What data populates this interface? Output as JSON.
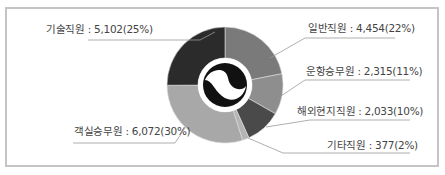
{
  "chart_data": {
    "type": "pie",
    "variant": "donut",
    "title": "",
    "categories": [
      "일반직원",
      "운항승무원",
      "해외현지직원",
      "기타직원",
      "객실승무원",
      "기술직원"
    ],
    "values": [
      4454,
      2315,
      2033,
      377,
      6072,
      5102
    ],
    "percentages": [
      22,
      11,
      10,
      2,
      30,
      25
    ],
    "colors": [
      "#7a7a7a",
      "#8e8e8e",
      "#4a4a4a",
      "#b4b4b4",
      "#a8a8a8",
      "#2b2b2b"
    ],
    "labels": [
      "일반직원 : 4,454(22%)",
      "운항승무원 : 2,315(11%)",
      "해외현지직원 : 2,033(10%)",
      "기타직원 : 377(2%)",
      "객실승무원 : 6,072(30%)",
      "기술직원 : 5,102(25%)"
    ],
    "start_angle": "12 o'clock",
    "direction": "clockwise",
    "legend": "leader-line labels"
  }
}
